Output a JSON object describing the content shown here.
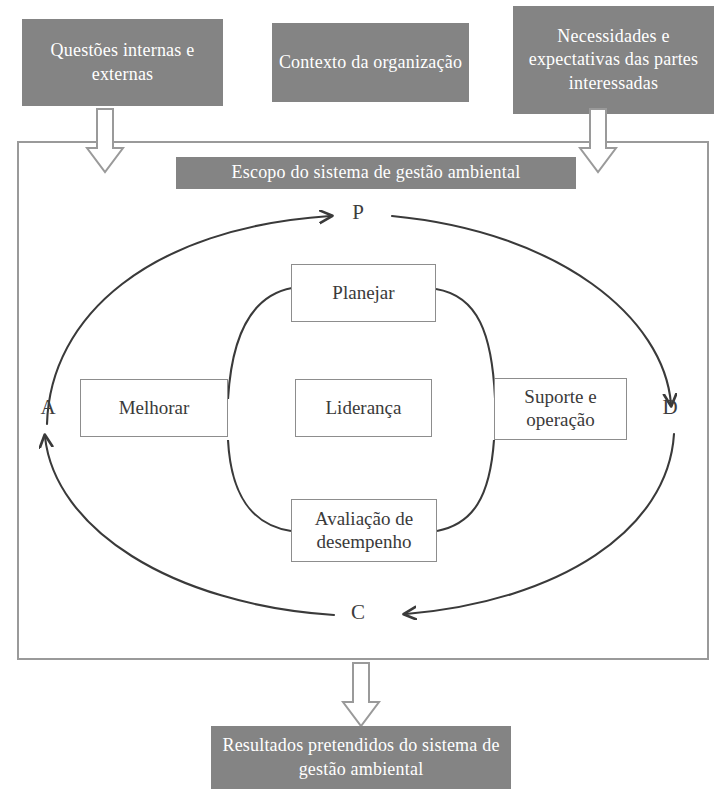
{
  "diagram": {
    "colors": {
      "gray_fill": "#848484",
      "gray_text": "#ffffff",
      "frame_border": "#9a9a9a",
      "box_border": "#8d8d8d",
      "arc_stroke": "#3a3a3a",
      "block_arrow_fill": "#ffffff",
      "block_arrow_stroke": "#9a9a9a",
      "background": "#ffffff"
    }
  },
  "inputs": {
    "left": "Questões internas e externas",
    "middle": "Contexto da organização",
    "right": "Necessidades e expectativas das partes interessadas"
  },
  "scope": {
    "label": "Escopo do sistema de gestão ambiental"
  },
  "cycle": {
    "letters": {
      "plan": "P",
      "do": "D",
      "check": "C",
      "act": "A"
    },
    "boxes": {
      "plan": "Planejar",
      "act": "Melhorar",
      "center": "Liderança",
      "do": "Suporte e operação",
      "check": "Avaliação de desempenho"
    }
  },
  "output": {
    "label": "Resultados pretendidos do sistema de gestão ambiental"
  },
  "arrows": {
    "input_left": "down-block-arrow",
    "input_right": "down-block-arrow",
    "output_bottom": "down-block-arrow",
    "cycle_top": "arc-arrow-to-plan",
    "cycle_right": "arc-arrow-to-do",
    "cycle_bottom": "arc-arrow-to-check",
    "cycle_left": "arc-arrow-to-act"
  }
}
